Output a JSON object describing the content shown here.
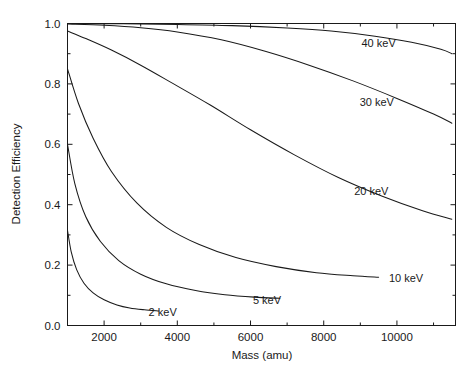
{
  "chart_data": {
    "type": "line",
    "title": "",
    "xlabel": "Mass (amu)",
    "ylabel": "Detection Efficiency",
    "xlim": [
      1000,
      11600
    ],
    "ylim": [
      0.0,
      1.0
    ],
    "grid": false,
    "legend_position": "inline-right-of-curve",
    "xticks": [
      2000,
      4000,
      6000,
      8000,
      10000
    ],
    "xticklabels": [
      "2000",
      "4000",
      "6000",
      "8000",
      "10000"
    ],
    "xminorticks": [
      1000,
      3000,
      5000,
      7000,
      9000,
      11000
    ],
    "yticks": [
      0.0,
      0.2,
      0.4,
      0.6,
      0.8,
      1.0
    ],
    "yticklabels": [
      "0.0",
      "0.2",
      "0.4",
      "0.6",
      "0.8",
      "1.0"
    ],
    "yminorticks": [
      0.1,
      0.3,
      0.5,
      0.7,
      0.9
    ],
    "series": [
      {
        "name": "2 keV",
        "label": "2 keV",
        "label_x": 3600,
        "label_y": 0.045,
        "x": [
          1000,
          1100,
          1250,
          1450,
          1700,
          2000,
          2350,
          2700,
          3100,
          3500
        ],
        "y": [
          0.315,
          0.245,
          0.185,
          0.14,
          0.108,
          0.085,
          0.068,
          0.058,
          0.052,
          0.048
        ]
      },
      {
        "name": "5 keV",
        "label": "5 keV",
        "label_x": 6450,
        "label_y": 0.085,
        "x": [
          1000,
          1200,
          1500,
          1900,
          2400,
          3000,
          3700,
          4500,
          5300,
          6100,
          6800
        ],
        "y": [
          0.6,
          0.47,
          0.36,
          0.278,
          0.215,
          0.17,
          0.138,
          0.116,
          0.102,
          0.094,
          0.09
        ]
      },
      {
        "name": "10 keV",
        "label": "10 keV",
        "label_x": 10250,
        "label_y": 0.158,
        "x": [
          1000,
          1300,
          1700,
          2200,
          2900,
          3700,
          4600,
          5600,
          6700,
          7800,
          8800,
          9500
        ],
        "y": [
          0.85,
          0.735,
          0.62,
          0.51,
          0.405,
          0.325,
          0.268,
          0.225,
          0.195,
          0.175,
          0.165,
          0.16
        ]
      },
      {
        "name": "20 keV",
        "label": "20 keV",
        "label_x": 9300,
        "label_y": 0.445,
        "x": [
          1000,
          1500,
          2200,
          3000,
          3900,
          4900,
          6000,
          7200,
          8400,
          9600,
          10700,
          11500
        ],
        "y": [
          0.975,
          0.95,
          0.912,
          0.862,
          0.8,
          0.73,
          0.648,
          0.565,
          0.49,
          0.428,
          0.38,
          0.352
        ]
      },
      {
        "name": "30 keV",
        "label": "30 keV",
        "label_x": 9450,
        "label_y": 0.74,
        "x": [
          1000,
          2000,
          3000,
          4000,
          5200,
          6400,
          7600,
          8800,
          10000,
          11000,
          11500
        ],
        "y": [
          0.998,
          0.994,
          0.986,
          0.972,
          0.946,
          0.908,
          0.862,
          0.81,
          0.752,
          0.7,
          0.67
        ]
      },
      {
        "name": "40 keV",
        "label": "40 keV",
        "label_x": 9500,
        "label_y": 0.935,
        "x": [
          1000,
          2500,
          4000,
          5500,
          7000,
          8200,
          9400,
          10400,
          11200,
          11500
        ],
        "y": [
          1.0,
          0.999,
          0.997,
          0.993,
          0.985,
          0.975,
          0.958,
          0.938,
          0.915,
          0.9
        ]
      }
    ]
  },
  "axes": {
    "x_title": "Mass (amu)",
    "y_title": "Detection Efficiency"
  }
}
